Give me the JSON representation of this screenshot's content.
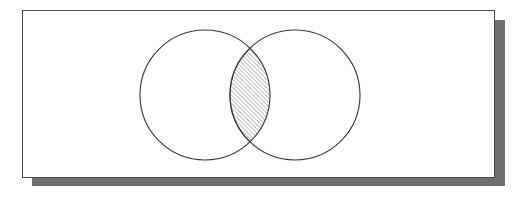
{
  "figure": {
    "type": "venn-diagram",
    "title": "Two-set Venn diagram with shaded intersection",
    "canvas": {
      "width": 527,
      "height": 198,
      "background": "#ffffff"
    },
    "panel": {
      "name": "diagram-panel",
      "x": 22,
      "y": 10,
      "width": 473,
      "height": 168,
      "fill": "#ffffff",
      "border_color": "#4a4a4a",
      "border_width": 1,
      "shadow": {
        "name": "panel-drop-shadow",
        "offset_x": 10,
        "offset_y": 10,
        "color": "#6f6f6f"
      }
    },
    "sets": [
      {
        "name": "left-circle",
        "label": "",
        "cx": 205,
        "cy": 95,
        "r": 65,
        "stroke": "#3a3a3a",
        "fill": "none"
      },
      {
        "name": "right-circle",
        "label": "",
        "cx": 295,
        "cy": 95,
        "r": 65,
        "stroke": "#3a3a3a",
        "fill": "none"
      }
    ],
    "intersection": {
      "name": "intersection-lens",
      "shaded": true,
      "fill_pattern": "diagonal-hatch",
      "hatch_angle_degrees": 45,
      "hatch_spacing": 3,
      "hatch_color": "#4f4f4f",
      "upper_crossing": {
        "x": 250,
        "y": 48
      },
      "lower_crossing": {
        "x": 250,
        "y": 142
      }
    },
    "labels": []
  }
}
